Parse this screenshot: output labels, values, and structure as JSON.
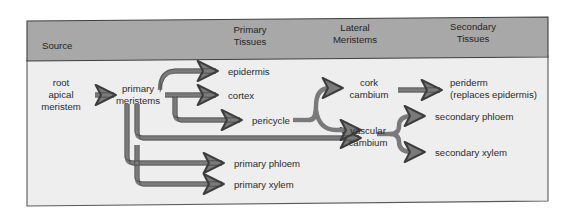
{
  "figure": {
    "kind": "flow-diagram",
    "panel": {
      "background_color": "#eeeeee",
      "border_color": "#555555"
    },
    "header_band": {
      "fill_color": "#a8a8a8",
      "border_color": "#4a4a4a",
      "columns": [
        {
          "id": "source",
          "label_line1": "Source",
          "label_line2": ""
        },
        {
          "id": "primary-tissues",
          "label_line1": "Primary",
          "label_line2": "Tissues"
        },
        {
          "id": "lateral-meristems",
          "label_line1": "Lateral",
          "label_line2": "Meristems"
        },
        {
          "id": "secondary-tissues",
          "label_line1": "Secondary",
          "label_line2": "Tissues"
        }
      ]
    },
    "arrow": {
      "fill_color": "#7a7a7a",
      "stroke_color": "#3d3d3d"
    }
  },
  "nodes": {
    "root_apical_meristem": {
      "id": "root-apical-meristem",
      "lines": [
        "root",
        "apical",
        "meristem"
      ],
      "column": "source"
    },
    "primary_meristems": {
      "id": "primary-meristems",
      "lines": [
        "primary",
        "meristems"
      ],
      "column": "source"
    },
    "epidermis": {
      "id": "epidermis",
      "lines": [
        "epidermis"
      ],
      "column": "primary-tissues"
    },
    "cortex": {
      "id": "cortex",
      "lines": [
        "cortex"
      ],
      "column": "primary-tissues"
    },
    "pericycle": {
      "id": "pericycle",
      "lines": [
        "pericycle"
      ],
      "column": "primary-tissues"
    },
    "primary_phloem": {
      "id": "primary-phloem",
      "lines": [
        "primary phloem"
      ],
      "column": "primary-tissues"
    },
    "primary_xylem": {
      "id": "primary-xylem",
      "lines": [
        "primary xylem"
      ],
      "column": "primary-tissues"
    },
    "cork_cambium": {
      "id": "cork-cambium",
      "lines": [
        "cork",
        "cambium"
      ],
      "column": "lateral-meristems"
    },
    "vascular_cambium": {
      "id": "vascular-cambium",
      "lines": [
        "vascular",
        "cambium"
      ],
      "column": "lateral-meristems"
    },
    "periderm": {
      "id": "periderm",
      "lines": [
        "periderm",
        "(replaces epidermis)"
      ],
      "column": "secondary-tissues"
    },
    "secondary_phloem": {
      "id": "secondary-phloem",
      "lines": [
        "secondary phloem"
      ],
      "column": "secondary-tissues"
    },
    "secondary_xylem": {
      "id": "secondary-xylem",
      "lines": [
        "secondary xylem"
      ],
      "column": "secondary-tissues"
    }
  },
  "edges": [
    {
      "from": "root_apical_meristem",
      "to": "primary_meristems"
    },
    {
      "from": "primary_meristems",
      "to": "epidermis"
    },
    {
      "from": "primary_meristems",
      "to": "cortex"
    },
    {
      "from": "primary_meristems",
      "to": "pericycle"
    },
    {
      "from": "primary_meristems",
      "to": "primary_phloem"
    },
    {
      "from": "primary_meristems",
      "to": "primary_xylem"
    },
    {
      "from": "pericycle",
      "to": "cork_cambium"
    },
    {
      "from": "pericycle",
      "to": "vascular_cambium"
    },
    {
      "from": "primary_meristems",
      "to": "vascular_cambium"
    },
    {
      "from": "cork_cambium",
      "to": "periderm"
    },
    {
      "from": "vascular_cambium",
      "to": "secondary_phloem"
    },
    {
      "from": "vascular_cambium",
      "to": "secondary_xylem"
    }
  ]
}
